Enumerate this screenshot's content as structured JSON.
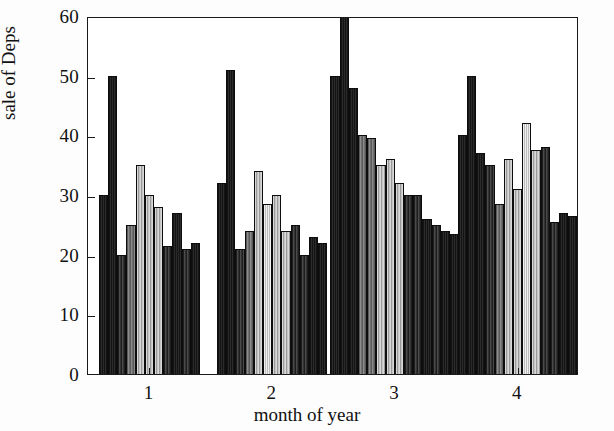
{
  "chart_data": {
    "type": "bar",
    "title": "",
    "xlabel": "month of year",
    "ylabel": "sale of Deps",
    "ylim": [
      0,
      60
    ],
    "yticks": [
      0,
      10,
      20,
      30,
      40,
      50,
      60
    ],
    "ytick_labels": [
      "0",
      "10",
      "20",
      "30",
      "40",
      "50",
      "60"
    ],
    "xlim": [
      0.5,
      4.5
    ],
    "xticks": [
      1,
      2,
      3,
      4
    ],
    "xtick_labels": [
      "1",
      "2",
      "3",
      "4"
    ],
    "categories": [
      "1",
      "2",
      "3",
      "4"
    ],
    "grid": false,
    "legend": false,
    "legend_position": "none",
    "note": "Grouped bar chart; each month has 9-10 sub-bars with alternating black/gray/white hatch fills. One bar in group 3 is clipped by the top of the axis (value exceeds 60).",
    "groups": [
      {
        "label": "1",
        "values": [
          30,
          50,
          20,
          25,
          35,
          30,
          28,
          21.5,
          27,
          21,
          22
        ],
        "fills": [
          "dark",
          "dark",
          "mid",
          "gray",
          "light",
          "light",
          "light",
          "mid",
          "dark",
          "mid",
          "dark"
        ]
      },
      {
        "label": "2",
        "values": [
          32,
          51,
          21,
          24,
          34,
          28.5,
          30,
          24,
          25,
          20,
          23,
          22
        ],
        "fills": [
          "dark",
          "dark",
          "mid",
          "gray",
          "light",
          "verylight",
          "light",
          "light",
          "mid",
          "mid",
          "dark",
          "dark"
        ]
      },
      {
        "label": "3",
        "values": [
          50,
          62,
          48,
          40,
          39.5,
          35,
          36,
          32,
          30,
          30,
          26,
          25,
          24,
          23.5
        ],
        "fills": [
          "dark",
          "dark",
          "dark",
          "gray",
          "gray",
          "light",
          "light",
          "light",
          "mid",
          "mid",
          "dark",
          "mid",
          "dark",
          "dark"
        ],
        "clipped_index": 1
      },
      {
        "label": "4",
        "values": [
          40,
          50,
          37,
          35,
          28.5,
          36,
          31,
          42,
          37.5,
          38,
          25.5,
          27,
          26.5
        ],
        "fills": [
          "dark",
          "dark",
          "dark",
          "mid",
          "gray",
          "light",
          "light",
          "verylight",
          "light",
          "mid",
          "mid",
          "dark",
          "dark"
        ]
      }
    ],
    "series_flat_values": [
      30,
      50,
      20,
      25,
      35,
      30,
      28,
      21.5,
      27,
      21,
      22,
      32,
      51,
      21,
      24,
      34,
      28.5,
      30,
      24,
      25,
      20,
      23,
      22,
      50,
      62,
      48,
      40,
      39.5,
      35,
      36,
      32,
      30,
      30,
      26,
      25,
      24,
      23.5,
      40,
      50,
      37,
      35,
      28.5,
      36,
      31,
      42,
      37.5,
      38,
      25.5,
      27,
      26.5
    ]
  },
  "axes": {
    "y_title": "sale of Deps",
    "x_title": "month of year"
  }
}
